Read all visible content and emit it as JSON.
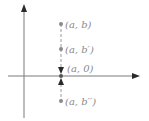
{
  "diagram": {
    "type": "coordinate-plane-vertical-convergence",
    "colors": {
      "axis": "#7a7a7a",
      "arrowhead": "#2a2a2a",
      "dashed_line": "#9a9a9a",
      "point": "#8a8a8a",
      "label": "#8a8a8a"
    },
    "axes": {
      "x_axis": "horizontal axis with arrow pointing right",
      "y_axis": "vertical axis with arrow pointing up"
    },
    "points": [
      {
        "id": "p-a-b",
        "label": "(a, b)"
      },
      {
        "id": "p-a-bprime",
        "label": "(a, b′)"
      },
      {
        "id": "p-a-0",
        "label": "(a, 0)"
      },
      {
        "id": "p-a-bdoubleprime",
        "label": "(a, b′′)"
      }
    ],
    "arrows": [
      {
        "id": "arrow-from-above",
        "direction": "down"
      },
      {
        "id": "arrow-from-below",
        "direction": "up"
      }
    ]
  }
}
